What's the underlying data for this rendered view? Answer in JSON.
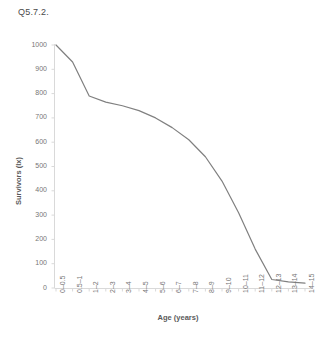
{
  "figure": {
    "title": "Q5.7.2."
  },
  "chart_data": {
    "type": "line",
    "title": "Q5.7.2.",
    "xlabel": "Age (years)",
    "ylabel": "Survivors (lx)",
    "categories": [
      "0–0.5",
      "0.5–1",
      "1–2",
      "2–3",
      "3–4",
      "4–5",
      "5–6",
      "6–7",
      "7–8",
      "8–9",
      "9–10",
      "10–11",
      "11–12",
      "12–13",
      "13–14",
      "14–15"
    ],
    "values": [
      1000,
      930,
      790,
      765,
      750,
      730,
      700,
      660,
      610,
      540,
      440,
      310,
      160,
      35,
      25,
      20
    ],
    "ylim": [
      0,
      1000
    ],
    "yticks": [
      0,
      100,
      200,
      300,
      400,
      500,
      600,
      700,
      800,
      900,
      1000
    ],
    "ytick_labels": [
      "0",
      "100",
      "200",
      "300",
      "400",
      "500",
      "600",
      "700",
      "800",
      "900",
      "1000"
    ],
    "grid": false,
    "legend": false,
    "series_color": "#808080",
    "axis_color": "#d9d9d9"
  }
}
